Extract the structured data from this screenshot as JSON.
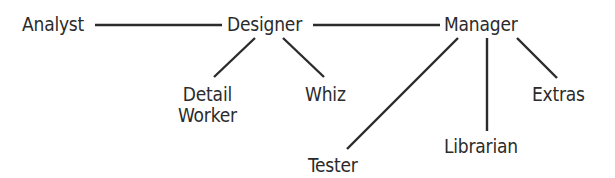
{
  "diagram": {
    "type": "hierarchy",
    "line_color": "#2b2b2b",
    "text_color": "#2b2b2b",
    "background": "#ffffff",
    "nodes": [
      {
        "id": "analyst",
        "label": "Analyst",
        "lines": [
          "Analyst"
        ],
        "x": 22,
        "y": 14
      },
      {
        "id": "designer",
        "label": "Designer",
        "lines": [
          "Designer"
        ],
        "x": 227,
        "y": 14
      },
      {
        "id": "manager",
        "label": "Manager",
        "lines": [
          "Manager"
        ],
        "x": 444,
        "y": 14
      },
      {
        "id": "detail-worker",
        "label": "Detail Worker",
        "lines": [
          "Detail",
          "Worker"
        ],
        "x": 178,
        "y": 84
      },
      {
        "id": "whiz",
        "label": "Whiz",
        "lines": [
          "Whiz"
        ],
        "x": 305,
        "y": 84
      },
      {
        "id": "extras",
        "label": "Extras",
        "lines": [
          "Extras"
        ],
        "x": 532,
        "y": 84
      },
      {
        "id": "librarian",
        "label": "Librarian",
        "lines": [
          "Librarian"
        ],
        "x": 444,
        "y": 136
      },
      {
        "id": "tester",
        "label": "Tester",
        "lines": [
          "Tester"
        ],
        "x": 308,
        "y": 155
      }
    ],
    "edges": [
      {
        "from": "analyst",
        "to": "designer",
        "x1": 95,
        "y1": 25,
        "x2": 222,
        "y2": 25
      },
      {
        "from": "designer",
        "to": "manager",
        "x1": 313,
        "y1": 25,
        "x2": 440,
        "y2": 25
      },
      {
        "from": "designer",
        "to": "detail-worker",
        "x1": 255,
        "y1": 38,
        "x2": 214,
        "y2": 77
      },
      {
        "from": "designer",
        "to": "whiz",
        "x1": 283,
        "y1": 38,
        "x2": 324,
        "y2": 77
      },
      {
        "from": "manager",
        "to": "tester",
        "x1": 458,
        "y1": 38,
        "x2": 347,
        "y2": 149
      },
      {
        "from": "manager",
        "to": "librarian",
        "x1": 487,
        "y1": 38,
        "x2": 487,
        "y2": 131
      },
      {
        "from": "manager",
        "to": "extras",
        "x1": 517,
        "y1": 38,
        "x2": 557,
        "y2": 78
      }
    ]
  }
}
